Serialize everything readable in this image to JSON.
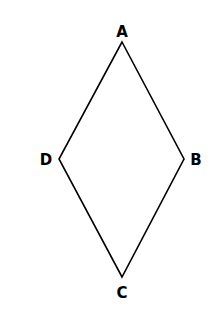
{
  "diagram": {
    "type": "rhombus",
    "stroke_color": "#000000",
    "vertices": [
      {
        "label": "A",
        "x": 122,
        "y": 42,
        "label_x": 122,
        "label_y": 37
      },
      {
        "label": "B",
        "x": 184,
        "y": 159,
        "label_x": 196,
        "label_y": 165
      },
      {
        "label": "C",
        "x": 122,
        "y": 277,
        "label_x": 122,
        "label_y": 298
      },
      {
        "label": "D",
        "x": 59,
        "y": 159,
        "label_x": 46,
        "label_y": 165
      }
    ]
  }
}
